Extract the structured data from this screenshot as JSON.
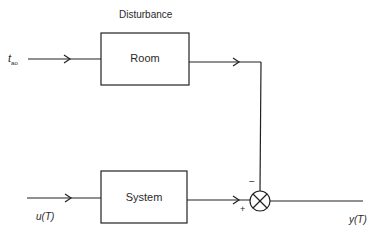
{
  "diagram": {
    "type": "block-diagram",
    "disturbance_label": "Disturbance",
    "blocks": [
      {
        "id": "room",
        "label": "Room"
      },
      {
        "id": "system",
        "label": "System"
      }
    ],
    "inputs": {
      "disturbance_input": {
        "symbol": "t",
        "subscript": "ao"
      },
      "control_input": "u(T)"
    },
    "output": "y(T)",
    "summing_junction": {
      "minus_sign": "−",
      "plus_sign": "+"
    },
    "colors": {
      "line": "#222222",
      "background": "#ffffff"
    }
  }
}
